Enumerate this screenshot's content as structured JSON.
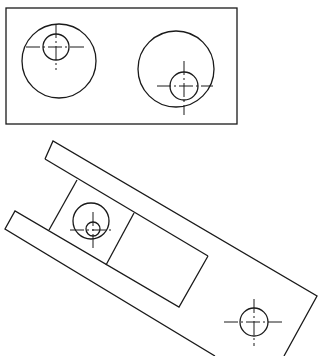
{
  "drawing": {
    "type": "mechanical-technical-drawing",
    "stroke_color": "#1a1a1a",
    "background": "#ffffff",
    "top_view": {
      "frame": {
        "x": 6,
        "y": 8,
        "w": 231,
        "h": 116
      },
      "holes": [
        {
          "name": "left-large-circle",
          "cx": 59,
          "cy": 61,
          "r": 37
        },
        {
          "name": "left-small-circle",
          "cx": 56,
          "cy": 47,
          "r": 13
        },
        {
          "name": "right-large-circle",
          "cx": 176,
          "cy": 69,
          "r": 38
        },
        {
          "name": "right-small-circle",
          "cx": 184,
          "cy": 86,
          "r": 14
        }
      ]
    },
    "rotated_view": {
      "parts": [
        "upper-arm",
        "lower-arm",
        "slider-block",
        "inner-rectangle"
      ],
      "holes": [
        {
          "name": "block-large-circle",
          "cx": 91,
          "cy": 221,
          "r": 18
        },
        {
          "name": "block-small-circle",
          "cx": 93,
          "cy": 229,
          "r": 7
        },
        {
          "name": "end-hole-circle",
          "cx": 254,
          "cy": 322,
          "r": 14
        }
      ]
    }
  }
}
